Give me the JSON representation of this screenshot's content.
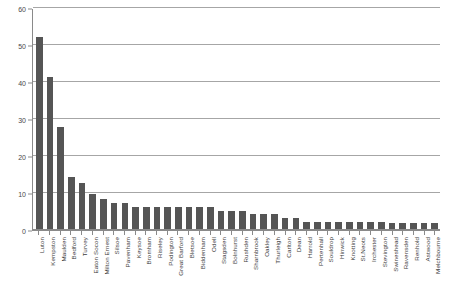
{
  "chart_data": {
    "type": "bar",
    "title": "",
    "subtitle": "",
    "xlabel": "",
    "ylabel": "",
    "ylim": [
      0,
      60
    ],
    "yticks": [
      0,
      10,
      20,
      30,
      40,
      50,
      60
    ],
    "grid": true,
    "legend": false,
    "legend_position": "none",
    "orientation": "vertical",
    "bar_color": "#555555",
    "grid_color": "#a6a6a6",
    "axis_color": "#8a8a8a",
    "categories": [
      "Luton",
      "Kempston",
      "Maulden",
      "Bedford",
      "Turvey",
      "Eaton Socon",
      "Milton Ernest",
      "Silsoe",
      "Pavenham",
      "Keysoe",
      "Bromham",
      "Riseley",
      "Podington",
      "Great Barford",
      "Bletsoe",
      "Biddenham",
      "Odell",
      "Stagsden",
      "Bolnhurst",
      "Rushden",
      "Sharnbrook",
      "Oakley",
      "Thurleigh",
      "Carlton",
      "Dean",
      "Harrold",
      "Pertenhall",
      "Souldrop",
      "Hinwick",
      "Knotting",
      "St.Neots",
      "Irchester",
      "Stevington",
      "Swineshead",
      "Ravensden",
      "Renhold",
      "Astwood",
      "Melchbourne"
    ],
    "values": [
      52,
      41,
      27.5,
      14,
      12.5,
      9.5,
      8,
      7,
      7,
      6,
      6,
      6,
      6,
      6,
      6,
      6,
      6,
      5,
      5,
      5,
      4,
      4,
      4,
      3,
      3,
      2,
      2,
      2,
      2,
      2,
      2,
      2,
      2,
      1.5,
      1.5,
      1.5,
      1.5,
      1.5
    ]
  }
}
